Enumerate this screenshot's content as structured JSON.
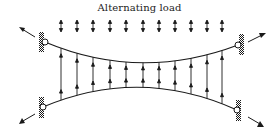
{
  "diagram": {
    "title": "Alternating load",
    "colors": {
      "line": "#1a1a1a",
      "background": "#ffffff"
    },
    "load_arrows": {
      "type": "double-headed-vertical",
      "x_positions": [
        61,
        77,
        93,
        110,
        126,
        143,
        159,
        175,
        191,
        207,
        222
      ],
      "y_top": 20,
      "y_bottom": 32
    },
    "members": {
      "top_curve": "sagging chord between upper pinned supports",
      "bottom_curve": "hogging chord between lower pinned supports",
      "verticals_count": 11
    },
    "supports": [
      {
        "position": "top-left",
        "type": "pin",
        "reaction_arrow": "up-left"
      },
      {
        "position": "top-right",
        "type": "pin",
        "reaction_arrow": "up-right"
      },
      {
        "position": "bottom-left",
        "type": "pin",
        "reaction_arrow": "down-left"
      },
      {
        "position": "bottom-right",
        "type": "pin",
        "reaction_arrow": "down-right"
      }
    ]
  }
}
